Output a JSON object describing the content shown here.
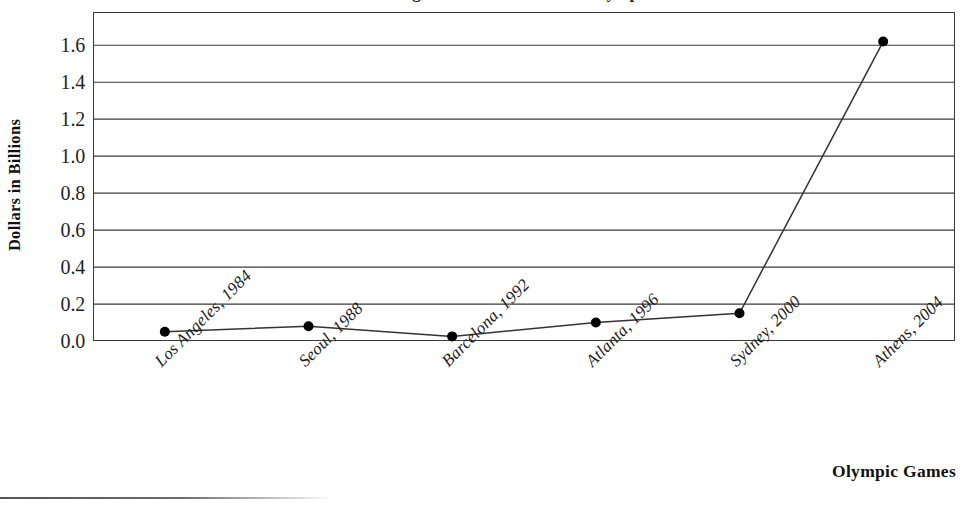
{
  "figure": {
    "title": "Broadcast Rights Revenue, Summer Olympics",
    "bottom_rule_label": "horizontal-rule"
  },
  "axes": {
    "y_title": "Dollars in Billions",
    "x_title": "Olympic Games",
    "y_ticks": [
      "0.0",
      "0.2",
      "0.4",
      "0.6",
      "0.8",
      "1.0",
      "1.2",
      "1.4",
      "1.6"
    ]
  },
  "chart_data": {
    "type": "line",
    "title": "Broadcast Rights Revenue, Summer Olympics",
    "xlabel": "Olympic Games",
    "ylabel": "Dollars in Billions",
    "categories": [
      "Los Angeles, 1984",
      "Seoul, 1988",
      "Barcelona, 1992",
      "Atlanta, 1996",
      "Sydney, 2000",
      "Athens, 2004"
    ],
    "values": [
      0.05,
      0.08,
      0.025,
      0.1,
      0.15,
      1.62
    ],
    "ylim": [
      0.0,
      1.78
    ],
    "ytick_values": [
      0.0,
      0.2,
      0.4,
      0.6,
      0.8,
      1.0,
      1.2,
      1.4,
      1.6
    ],
    "grid": "horizontal",
    "legend": "none",
    "marker": "filled-circle",
    "marker_color": "#000000",
    "line_color": "#333333"
  }
}
